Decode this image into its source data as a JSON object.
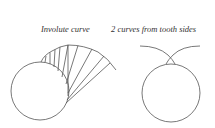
{
  "labels": {
    "left": "Involute curve",
    "right": "2 curves from tooth sides"
  },
  "diagrams": {
    "left": {
      "title": "Involute curve",
      "base_circle": {
        "cx": 40,
        "cy": 91,
        "r": 29
      },
      "description": "Involute curve generated by tangent lines unwinding from base circle"
    },
    "right": {
      "title": "2 curves from tooth sides",
      "base_circle": {
        "cx": 171,
        "cy": 93,
        "r": 29
      },
      "description": "Two involute curves from opposite tooth sides intersecting above base circle"
    }
  },
  "colors": {
    "stroke": "#555555",
    "text": "#333333",
    "background": "#ffffff"
  }
}
